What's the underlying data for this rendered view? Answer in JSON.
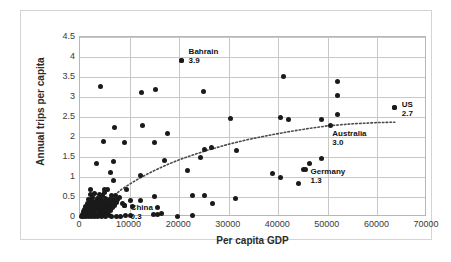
{
  "chart_data": {
    "type": "scatter",
    "title": "",
    "xlabel": "Per capita GDP",
    "ylabel": "Annual trips per capita",
    "xlim": [
      0,
      70000
    ],
    "ylim": [
      0,
      4.5
    ],
    "xticks": [
      "0",
      "10000",
      "20000",
      "30000",
      "40000",
      "50000",
      "60000",
      "70000"
    ],
    "xtick_values": [
      0,
      10000,
      20000,
      30000,
      40000,
      50000,
      60000,
      70000
    ],
    "yticks": [
      "0",
      "0.5",
      "1",
      "1.5",
      "2",
      "2.5",
      "3",
      "3.5",
      "4",
      "4.5"
    ],
    "ytick_values": [
      0,
      0.5,
      1,
      1.5,
      2,
      2.5,
      3,
      3.5,
      4,
      4.5
    ],
    "grid": true,
    "legend": "none",
    "marker_color": "#1a1a1a",
    "trendline": {
      "style": "dotted",
      "color": "#4a4a4a",
      "shape": "logarithmic",
      "points": [
        [
          7000,
          0.55
        ],
        [
          8500,
          0.7
        ],
        [
          10000,
          0.82
        ],
        [
          12000,
          0.97
        ],
        [
          14000,
          1.1
        ],
        [
          16000,
          1.22
        ],
        [
          18000,
          1.33
        ],
        [
          20000,
          1.43
        ],
        [
          23000,
          1.56
        ],
        [
          26000,
          1.68
        ],
        [
          30000,
          1.82
        ],
        [
          34000,
          1.94
        ],
        [
          38000,
          2.04
        ],
        [
          42000,
          2.13
        ],
        [
          46000,
          2.21
        ],
        [
          50000,
          2.28
        ],
        [
          55000,
          2.33
        ],
        [
          60000,
          2.36
        ],
        [
          63500,
          2.37
        ]
      ]
    },
    "annotations": [
      {
        "label": "Bahrain",
        "value": "3.9",
        "x": 20500,
        "y": 3.92,
        "dx": 7,
        "dy": -13
      },
      {
        "label": "US",
        "value": "2.7",
        "x": 63500,
        "y": 2.74,
        "dx": 7,
        "dy": -7
      },
      {
        "label": "Australia",
        "value": "3.0",
        "x": 50500,
        "y": 2.28,
        "dx": 2,
        "dy": 3
      },
      {
        "label": "Germany",
        "value": "1.3",
        "x": 45500,
        "y": 1.2,
        "dx": 5,
        "dy": -2
      },
      {
        "label": "China",
        "value": "0.3",
        "x": 9000,
        "y": 0.28,
        "dx": 6,
        "dy": -3
      }
    ],
    "points": [
      [
        4200,
        3.26
      ],
      [
        12400,
        3.11
      ],
      [
        15300,
        3.2
      ],
      [
        20500,
        3.92
      ],
      [
        24900,
        3.14
      ],
      [
        41000,
        3.52
      ],
      [
        52000,
        3.39
      ],
      [
        52000,
        3.04
      ],
      [
        63500,
        2.74
      ],
      [
        52000,
        2.56
      ],
      [
        40500,
        2.5
      ],
      [
        42000,
        2.44
      ],
      [
        48700,
        2.44
      ],
      [
        30400,
        2.47
      ],
      [
        12600,
        2.29
      ],
      [
        6900,
        2.25
      ],
      [
        17600,
        2.1
      ],
      [
        4800,
        1.89
      ],
      [
        8900,
        1.87
      ],
      [
        15100,
        1.86
      ],
      [
        26600,
        1.74
      ],
      [
        25100,
        1.68
      ],
      [
        31500,
        1.66
      ],
      [
        48800,
        1.47
      ],
      [
        46300,
        1.35
      ],
      [
        6800,
        1.39
      ],
      [
        17000,
        1.41
      ],
      [
        24400,
        1.48
      ],
      [
        3400,
        1.33
      ],
      [
        45000,
        1.2
      ],
      [
        38800,
        1.08
      ],
      [
        40500,
        1.0
      ],
      [
        12300,
        1.03
      ],
      [
        6200,
        1.12
      ],
      [
        21600,
        1.16
      ],
      [
        6700,
        0.92
      ],
      [
        44000,
        0.84
      ],
      [
        5000,
        0.7
      ],
      [
        5600,
        0.7
      ],
      [
        9300,
        0.69
      ],
      [
        3000,
        0.6
      ],
      [
        2100,
        0.56
      ],
      [
        3900,
        0.57
      ],
      [
        4600,
        0.55
      ],
      [
        6400,
        0.54
      ],
      [
        7100,
        0.54
      ],
      [
        22600,
        0.53
      ],
      [
        25100,
        0.53
      ],
      [
        15000,
        0.51
      ],
      [
        8000,
        0.48
      ],
      [
        31300,
        0.46
      ],
      [
        26700,
        0.34
      ],
      [
        2600,
        0.5
      ],
      [
        3500,
        0.47
      ],
      [
        4200,
        0.46
      ],
      [
        5100,
        0.46
      ],
      [
        5900,
        0.45
      ],
      [
        6700,
        0.44
      ],
      [
        7600,
        0.43
      ],
      [
        10200,
        0.42
      ],
      [
        12200,
        0.41
      ],
      [
        1800,
        0.43
      ],
      [
        2400,
        0.41
      ],
      [
        3100,
        0.4
      ],
      [
        3800,
        0.39
      ],
      [
        4500,
        0.38
      ],
      [
        5200,
        0.38
      ],
      [
        6000,
        0.37
      ],
      [
        6800,
        0.36
      ],
      [
        7400,
        0.36
      ],
      [
        8600,
        0.35
      ],
      [
        1500,
        0.35
      ],
      [
        2000,
        0.34
      ],
      [
        2700,
        0.33
      ],
      [
        3300,
        0.32
      ],
      [
        4000,
        0.32
      ],
      [
        4700,
        0.31
      ],
      [
        5400,
        0.31
      ],
      [
        6100,
        0.3
      ],
      [
        7000,
        0.3
      ],
      [
        9000,
        0.28
      ],
      [
        1200,
        0.27
      ],
      [
        1700,
        0.26
      ],
      [
        2300,
        0.26
      ],
      [
        2900,
        0.25
      ],
      [
        3600,
        0.25
      ],
      [
        4300,
        0.24
      ],
      [
        5000,
        0.24
      ],
      [
        5700,
        0.23
      ],
      [
        6500,
        0.23
      ],
      [
        10500,
        0.26
      ],
      [
        900,
        0.2
      ],
      [
        1400,
        0.19
      ],
      [
        1900,
        0.19
      ],
      [
        2500,
        0.18
      ],
      [
        3200,
        0.18
      ],
      [
        3900,
        0.17
      ],
      [
        4600,
        0.17
      ],
      [
        5300,
        0.16
      ],
      [
        6100,
        0.16
      ],
      [
        15600,
        0.25
      ],
      [
        700,
        0.13
      ],
      [
        1100,
        0.12
      ],
      [
        1600,
        0.12
      ],
      [
        2200,
        0.11
      ],
      [
        2800,
        0.11
      ],
      [
        3500,
        0.1
      ],
      [
        4200,
        0.1
      ],
      [
        4900,
        0.09
      ],
      [
        5600,
        0.09
      ],
      [
        16400,
        0.1
      ],
      [
        500,
        0.06
      ],
      [
        900,
        0.05
      ],
      [
        1300,
        0.05
      ],
      [
        1800,
        0.05
      ],
      [
        2400,
        0.04
      ],
      [
        3000,
        0.04
      ],
      [
        3700,
        0.04
      ],
      [
        4400,
        0.03
      ],
      [
        5100,
        0.03
      ],
      [
        6000,
        0.03
      ],
      [
        400,
        0.02
      ],
      [
        800,
        0.02
      ],
      [
        1200,
        0.02
      ],
      [
        1700,
        0.02
      ],
      [
        2300,
        0.01
      ],
      [
        2900,
        0.01
      ],
      [
        3600,
        0.01
      ],
      [
        4300,
        0.01
      ],
      [
        5200,
        0.01
      ],
      [
        6400,
        0.01
      ],
      [
        7300,
        0.02
      ],
      [
        8200,
        0.02
      ],
      [
        9100,
        0.05
      ],
      [
        10100,
        0.03
      ],
      [
        19600,
        0.02
      ],
      [
        22600,
        0.03
      ],
      [
        14800,
        0.07
      ],
      [
        15600,
        0.06
      ],
      [
        2100,
        0.7
      ],
      [
        4900,
        0.62
      ]
    ]
  }
}
